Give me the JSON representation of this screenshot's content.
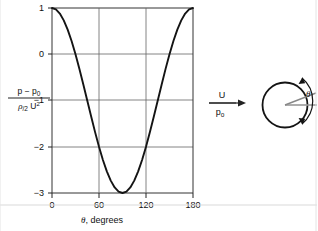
{
  "figure": {
    "name": "pressure-distribution-around-cylinder",
    "axis_color": "#222222",
    "grid_color": "#555555",
    "curve_color": "#1a1a1a",
    "baseline_color": "#999999"
  },
  "chart_data": {
    "type": "line",
    "title": "",
    "xlabel_parts": {
      "symbol": "θ",
      "text": ", degrees"
    },
    "ylabel_parts": {
      "numerator": "p − p",
      "numerator_sub": "0",
      "denominator_rho": "ρ",
      "denominator_half": "/2",
      "denominator_u": "U",
      "denominator_exp": "2"
    },
    "xlim": [
      0,
      180
    ],
    "ylim": [
      -3,
      1
    ],
    "xticks": [
      0,
      60,
      120,
      180
    ],
    "xtick_labels": [
      "0",
      "60",
      "120",
      "180"
    ],
    "yticks": [
      1,
      0,
      -1,
      -2,
      -3
    ],
    "ytick_labels": [
      "1",
      "0",
      "−1",
      "−2",
      "−3"
    ],
    "grid": true,
    "legend": "none",
    "series": [
      {
        "name": "Cp = 1 - 4 sin^2(theta)",
        "x": [
          0,
          5,
          10,
          15,
          20,
          25,
          30,
          35,
          40,
          45,
          50,
          55,
          60,
          65,
          70,
          75,
          80,
          85,
          90,
          95,
          100,
          105,
          110,
          115,
          120,
          125,
          130,
          135,
          140,
          145,
          150,
          155,
          160,
          165,
          170,
          175,
          180
        ],
        "y": [
          1,
          0.9696,
          0.8794,
          0.7321,
          0.5321,
          0.2858,
          0,
          -0.3166,
          -0.6527,
          -1,
          -1.3473,
          -1.6834,
          -2,
          -2.2858,
          -2.5321,
          -2.7321,
          -2.8794,
          -2.9696,
          -3,
          -2.9696,
          -2.8794,
          -2.7321,
          -2.5321,
          -2.2858,
          -2,
          -1.6834,
          -1.3473,
          -1,
          -0.6527,
          -0.3166,
          0,
          0.2858,
          0.5321,
          0.7321,
          0.8794,
          0.9696,
          1
        ]
      }
    ]
  },
  "annotations": {
    "flow_label": {
      "velocity": "U",
      "pressure": "p",
      "pressure_sub": "o"
    },
    "cylinder": {
      "angle_symbol": "θ"
    }
  }
}
